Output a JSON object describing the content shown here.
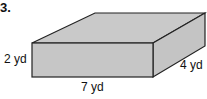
{
  "problem": {
    "number": "3.",
    "shape": "rectangular prism",
    "dimensions": {
      "height": "2 yd",
      "length": "7 yd",
      "width": "4 yd"
    }
  },
  "colors": {
    "fill": "#c8c8c8",
    "stroke": "#222222"
  }
}
